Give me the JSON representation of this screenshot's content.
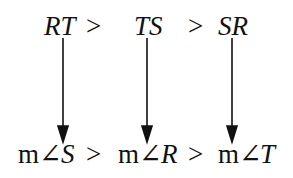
{
  "top_row": {
    "items": [
      "RT",
      "TS",
      "SR"
    ],
    "operators": [
      ">",
      ">"
    ]
  },
  "bottom_row": {
    "prefix": "m∠",
    "items": [
      "S",
      "R",
      "T"
    ],
    "operators": [
      ">",
      ">"
    ]
  },
  "arrows": [
    {
      "from": "RT",
      "to": "m∠S"
    },
    {
      "from": "TS",
      "to": "m∠R"
    },
    {
      "from": "SR",
      "to": "m∠T"
    }
  ]
}
